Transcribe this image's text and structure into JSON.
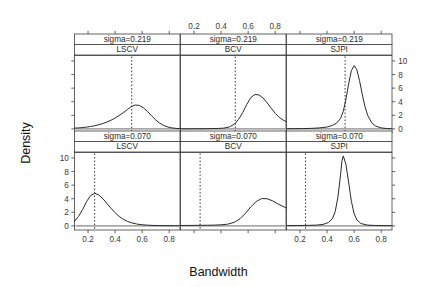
{
  "figure": {
    "xlabel": "Bandwidth",
    "ylabel": "Density"
  },
  "chart_data": {
    "type": "line",
    "title": "",
    "xlabel": "Bandwidth",
    "ylabel": "Density",
    "xlim": [
      0.1,
      0.88
    ],
    "ylim": [
      -0.6,
      10.8
    ],
    "grid": false,
    "legend": null,
    "layout": {
      "rows": 2,
      "cols": 3
    },
    "x_ticks_top": [
      "0.2",
      "0.4",
      "0.6",
      "0.8"
    ],
    "x_ticks_bottom": [
      "0.2",
      "0.4",
      "0.6",
      "0.8"
    ],
    "y_ticks_left": [
      "0",
      "2",
      "4",
      "6",
      "8",
      "10"
    ],
    "y_ticks_right": [
      "0",
      "2",
      "4",
      "6",
      "8",
      "10"
    ],
    "x_tick_values": [
      0.2,
      0.4,
      0.6,
      0.8
    ],
    "y_tick_values": [
      0,
      2,
      4,
      6,
      8,
      10
    ],
    "panels": [
      {
        "row": 0,
        "col": 0,
        "strip_top": "sigma=0.219",
        "strip_bottom": "LSCV",
        "vline_x": 0.523,
        "axis_left": false,
        "axis_right": false,
        "axis_top": false,
        "axis_bottom": true,
        "x": [
          0.1,
          0.13,
          0.16,
          0.19,
          0.22,
          0.25,
          0.28,
          0.31,
          0.34,
          0.37,
          0.4,
          0.43,
          0.46,
          0.49,
          0.52,
          0.55,
          0.58,
          0.61,
          0.64,
          0.67,
          0.7,
          0.73,
          0.76,
          0.79,
          0.82,
          0.85,
          0.88
        ],
        "y": [
          0.12,
          0.15,
          0.2,
          0.27,
          0.36,
          0.47,
          0.62,
          0.8,
          1.02,
          1.28,
          1.6,
          1.97,
          2.38,
          2.85,
          3.28,
          3.52,
          3.45,
          3.1,
          2.55,
          1.92,
          1.33,
          0.85,
          0.5,
          0.28,
          0.15,
          0.08,
          0.04
        ]
      },
      {
        "row": 0,
        "col": 1,
        "strip_top": "sigma=0.219",
        "strip_bottom": "BCV",
        "vline_x": 0.505,
        "axis_left": false,
        "axis_right": false,
        "axis_top": true,
        "axis_bottom": false,
        "x": [
          0.1,
          0.14,
          0.18,
          0.22,
          0.26,
          0.3,
          0.34,
          0.38,
          0.42,
          0.46,
          0.5,
          0.53,
          0.56,
          0.59,
          0.62,
          0.65,
          0.68,
          0.71,
          0.74,
          0.77,
          0.8,
          0.83,
          0.86,
          0.88
        ],
        "y": [
          0.02,
          0.02,
          0.02,
          0.03,
          0.03,
          0.04,
          0.05,
          0.07,
          0.12,
          0.28,
          0.72,
          1.42,
          2.4,
          3.6,
          4.62,
          5.06,
          5.0,
          4.55,
          3.86,
          3.05,
          2.3,
          1.7,
          1.28,
          1.1
        ]
      },
      {
        "row": 0,
        "col": 2,
        "strip_top": "sigma=0.219",
        "strip_bottom": "SJPI",
        "vline_x": 0.533,
        "axis_left": false,
        "axis_right": true,
        "axis_top": false,
        "axis_bottom": false,
        "x": [
          0.1,
          0.16,
          0.22,
          0.28,
          0.34,
          0.4,
          0.44,
          0.47,
          0.5,
          0.52,
          0.54,
          0.56,
          0.58,
          0.6,
          0.62,
          0.64,
          0.66,
          0.68,
          0.7,
          0.73,
          0.76,
          0.8,
          0.84,
          0.88
        ],
        "y": [
          0.03,
          0.04,
          0.05,
          0.08,
          0.14,
          0.28,
          0.52,
          0.85,
          1.55,
          2.6,
          4.4,
          6.7,
          8.6,
          9.3,
          8.7,
          7.1,
          5.1,
          3.3,
          2.0,
          0.9,
          0.4,
          0.15,
          0.06,
          0.03
        ]
      },
      {
        "row": 1,
        "col": 0,
        "strip_top": "sigma=0.070",
        "strip_bottom": "LSCV",
        "vline_x": 0.249,
        "axis_left": true,
        "axis_right": false,
        "axis_top": false,
        "axis_bottom": true,
        "x": [
          0.1,
          0.13,
          0.16,
          0.19,
          0.22,
          0.25,
          0.28,
          0.31,
          0.34,
          0.37,
          0.4,
          0.43,
          0.46,
          0.49,
          0.52,
          0.56,
          0.6,
          0.64,
          0.68,
          0.72,
          0.76,
          0.8,
          0.84,
          0.88
        ],
        "y": [
          0.7,
          1.4,
          2.4,
          3.6,
          4.5,
          4.8,
          4.55,
          4.0,
          3.3,
          2.6,
          1.95,
          1.4,
          0.98,
          0.68,
          0.46,
          0.28,
          0.17,
          0.11,
          0.07,
          0.05,
          0.04,
          0.03,
          0.03,
          0.02
        ]
      },
      {
        "row": 1,
        "col": 1,
        "strip_top": "sigma=0.070",
        "strip_bottom": "BCV",
        "vline_x": 0.245,
        "axis_left": false,
        "axis_right": false,
        "axis_top": false,
        "axis_bottom": false,
        "x": [
          0.1,
          0.15,
          0.2,
          0.25,
          0.3,
          0.35,
          0.4,
          0.45,
          0.5,
          0.54,
          0.58,
          0.62,
          0.66,
          0.7,
          0.74,
          0.78,
          0.82,
          0.85,
          0.88
        ],
        "y": [
          0.06,
          0.07,
          0.08,
          0.09,
          0.1,
          0.12,
          0.16,
          0.26,
          0.55,
          1.05,
          1.85,
          2.8,
          3.6,
          4.02,
          4.0,
          3.7,
          3.25,
          2.95,
          2.65
        ]
      },
      {
        "row": 1,
        "col": 2,
        "strip_top": "sigma=0.070",
        "strip_bottom": "SJPI",
        "vline_x": 0.241,
        "axis_left": false,
        "axis_right": false,
        "axis_top": false,
        "axis_bottom": true,
        "x": [
          0.1,
          0.18,
          0.26,
          0.32,
          0.37,
          0.41,
          0.44,
          0.46,
          0.48,
          0.5,
          0.51,
          0.52,
          0.54,
          0.56,
          0.58,
          0.6,
          0.62,
          0.65,
          0.7,
          0.76,
          0.82,
          0.88
        ],
        "y": [
          0.05,
          0.06,
          0.08,
          0.12,
          0.22,
          0.5,
          1.1,
          2.1,
          4.2,
          7.6,
          9.6,
          10.3,
          9.0,
          6.3,
          3.6,
          1.8,
          0.9,
          0.35,
          0.12,
          0.06,
          0.04,
          0.03
        ]
      }
    ]
  }
}
